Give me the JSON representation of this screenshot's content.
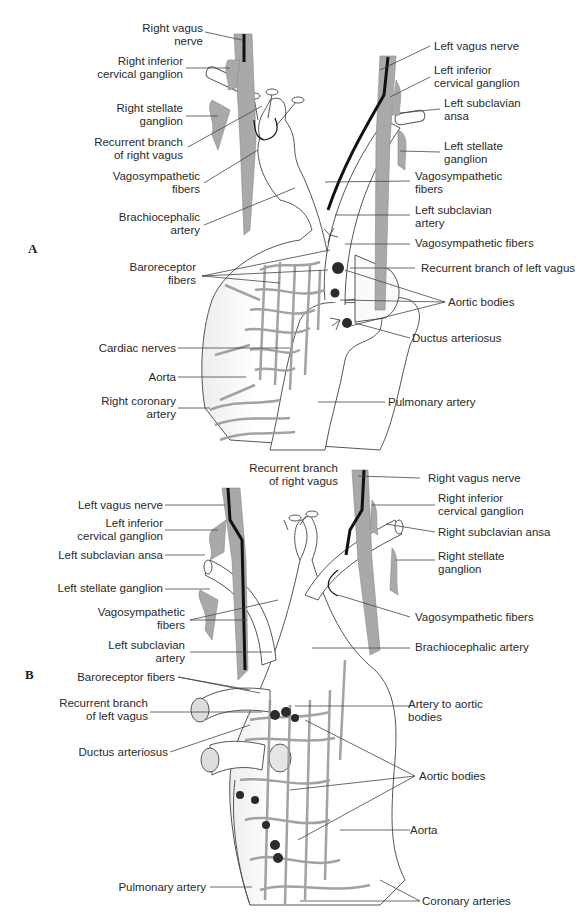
{
  "colors": {
    "nerve_gray": "#a9a9a9",
    "vessel_fill": "#ffffff",
    "outline": "#555555",
    "vagus_black": "#111111",
    "aortic_body": "#2b2b2b",
    "leader_line": "#444444"
  },
  "panels": [
    {
      "letter": "A",
      "labels_left": [
        "Right vagus nerve",
        "Right inferior cervical ganglion",
        "Right stellate ganglion",
        "Recurrent branch of right vagus",
        "Vagosympathetic fibers",
        "Brachiocephalic artery",
        "Baroreceptor fibers",
        "Cardiac nerves",
        "Aorta",
        "Right coronary artery"
      ],
      "labels_right": [
        "Left vagus nerve",
        "Left inferior cervical ganglion",
        "Left subclavian ansa",
        "Left stellate ganglion",
        "Vagosympathetic fibers",
        "Left subclavian artery",
        "Vagosympathetic fibers",
        "Recurrent branch of left vagus",
        "Aortic bodies",
        "Ductus arteriosus",
        "Pulmonary artery"
      ]
    },
    {
      "letter": "B",
      "labels_left": [
        "Left vagus nerve",
        "Left inferior cervical ganglion",
        "Left subclavian ansa",
        "Left stellate ganglion",
        "Vagosympathetic fibers",
        "Left subclavian artery",
        "Baroreceptor fibers",
        "Recurrent branch of left vagus",
        "Ductus arteriosus",
        "Pulmonary artery"
      ],
      "labels_top": [
        "Recurrent branch of right vagus"
      ],
      "labels_right": [
        "Right vagus nerve",
        "Right inferior cervical ganglion",
        "Right subclavian ansa",
        "Right stellate ganglion",
        "Vagosympathetic fibers",
        "Brachiocephalic artery",
        "Artery to aortic bodies",
        "Aortic bodies",
        "Aorta",
        "Coronary arteries"
      ]
    }
  ],
  "a": {
    "letter": "A",
    "right_vagus_1": "Right vagus",
    "right_vagus_2": "nerve",
    "r_inf_1": "Right inferior",
    "r_inf_2": "cervical ganglion",
    "r_stel_1": "Right stellate",
    "r_stel_2": "ganglion",
    "rec_r_1": "Recurrent branch",
    "rec_r_2": "of right vagus",
    "vs_l_1": "Vagosympathetic",
    "vs_l_2": "fibers",
    "brach_1": "Brachiocephalic",
    "brach_2": "artery",
    "baro_1": "Baroreceptor",
    "baro_2": "fibers",
    "cardiac": "Cardiac nerves",
    "aorta": "Aorta",
    "rca_1": "Right coronary",
    "rca_2": "artery",
    "lvagus": "Left vagus nerve",
    "l_inf_1": "Left inferior",
    "l_inf_2": "cervical ganglion",
    "l_ansa_1": "Left subclavian",
    "l_ansa_2": "ansa",
    "l_stel_1": "Left stellate",
    "l_stel_2": "ganglion",
    "vs_r_1": "Vagosympathetic",
    "vs_r_2": "fibers",
    "lsub_1": "Left subclavian",
    "lsub_2": "artery",
    "vs_r3": "Vagosympathetic fibers",
    "rec_l": "Recurrent branch of left vagus",
    "aortic_bodies": "Aortic bodies",
    "ductus": "Ductus arteriosus",
    "pulm": "Pulmonary artery"
  },
  "b": {
    "letter": "B",
    "lvagus": "Left vagus nerve",
    "l_inf_1": "Left inferior",
    "l_inf_2": "cervical ganglion",
    "l_ansa": "Left subclavian ansa",
    "l_stel": "Left stellate ganglion",
    "vs_l_1": "Vagosympathetic",
    "vs_l_2": "fibers",
    "lsub_1": "Left subclavian",
    "lsub_2": "artery",
    "baro": "Baroreceptor fibers",
    "rec_l_1": "Recurrent branch",
    "rec_l_2": "of left vagus",
    "ductus": "Ductus arteriosus",
    "pulm": "Pulmonary artery",
    "rec_r_1": "Recurrent branch",
    "rec_r_2": "of right vagus",
    "rvagus": "Right vagus nerve",
    "r_inf_1": "Right inferior",
    "r_inf_2": "cervical ganglion",
    "r_ansa": "Right subclavian ansa",
    "r_stel_1": "Right stellate",
    "r_stel_2": "ganglion",
    "vs_r": "Vagosympathetic fibers",
    "brach": "Brachiocephalic artery",
    "art_ab_1": "Artery to aortic",
    "art_ab_2": "bodies",
    "aortic_bodies": "Aortic bodies",
    "aorta": "Aorta",
    "coronary": "Coronary arteries"
  }
}
